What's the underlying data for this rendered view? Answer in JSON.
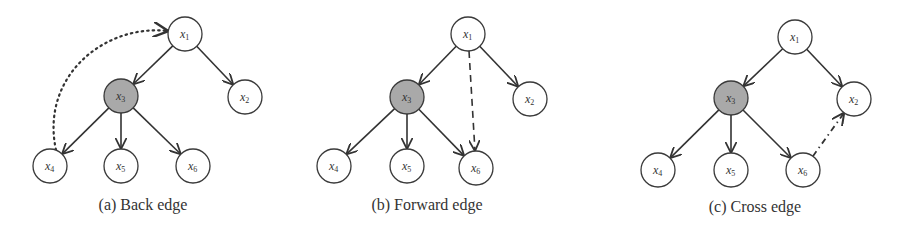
{
  "colors": {
    "stroke": "#333333",
    "node_fill": "#ffffff",
    "highlight_fill": "#a9a9a9",
    "background": "#ffffff"
  },
  "panels": [
    {
      "id": "a",
      "caption": "(a) Back edge",
      "caption_pos": [
        143,
        210
      ],
      "nodes": [
        {
          "id": "x1",
          "base": "x",
          "sub": "1",
          "cx": 185,
          "cy": 34,
          "highlight": false
        },
        {
          "id": "x2",
          "base": "x",
          "sub": "2",
          "cx": 245,
          "cy": 97,
          "highlight": false
        },
        {
          "id": "x3",
          "base": "x",
          "sub": "3",
          "cx": 121,
          "cy": 96,
          "highlight": true
        },
        {
          "id": "x4",
          "base": "x",
          "sub": "4",
          "cx": 50,
          "cy": 166,
          "highlight": false
        },
        {
          "id": "x5",
          "base": "x",
          "sub": "5",
          "cx": 121,
          "cy": 166,
          "highlight": false
        },
        {
          "id": "x6",
          "base": "x",
          "sub": "6",
          "cx": 193,
          "cy": 166,
          "highlight": false
        }
      ],
      "edges": [
        {
          "from": "x1",
          "to": "x3",
          "style": "solid"
        },
        {
          "from": "x1",
          "to": "x2",
          "style": "solid"
        },
        {
          "from": "x3",
          "to": "x4",
          "style": "solid"
        },
        {
          "from": "x3",
          "to": "x5",
          "style": "solid"
        },
        {
          "from": "x3",
          "to": "x6",
          "style": "solid"
        },
        {
          "from": "x4",
          "to": "x1",
          "style": "dotted",
          "curve": true,
          "label": "back-edge"
        }
      ]
    },
    {
      "id": "b",
      "caption": "(b) Forward edge",
      "caption_pos": [
        427,
        210
      ],
      "nodes": [
        {
          "id": "x1",
          "base": "x",
          "sub": "1",
          "cx": 468,
          "cy": 34,
          "highlight": false
        },
        {
          "id": "x2",
          "base": "x",
          "sub": "2",
          "cx": 530,
          "cy": 99,
          "highlight": false
        },
        {
          "id": "x3",
          "base": "x",
          "sub": "3",
          "cx": 407,
          "cy": 97,
          "highlight": true
        },
        {
          "id": "x4",
          "base": "x",
          "sub": "4",
          "cx": 334,
          "cy": 166,
          "highlight": false
        },
        {
          "id": "x5",
          "base": "x",
          "sub": "5",
          "cx": 407,
          "cy": 166,
          "highlight": false
        },
        {
          "id": "x6",
          "base": "x",
          "sub": "6",
          "cx": 476,
          "cy": 168,
          "highlight": false
        }
      ],
      "edges": [
        {
          "from": "x1",
          "to": "x3",
          "style": "solid"
        },
        {
          "from": "x1",
          "to": "x2",
          "style": "solid"
        },
        {
          "from": "x3",
          "to": "x4",
          "style": "solid"
        },
        {
          "from": "x3",
          "to": "x5",
          "style": "solid"
        },
        {
          "from": "x3",
          "to": "x6",
          "style": "solid"
        },
        {
          "from": "x1",
          "to": "x6",
          "style": "dashed",
          "label": "forward-edge"
        }
      ]
    },
    {
      "id": "c",
      "caption": "(c) Cross edge",
      "caption_pos": [
        755,
        212
      ],
      "nodes": [
        {
          "id": "x1",
          "base": "x",
          "sub": "1",
          "cx": 795,
          "cy": 37,
          "highlight": false
        },
        {
          "id": "x2",
          "base": "x",
          "sub": "2",
          "cx": 854,
          "cy": 99,
          "highlight": false
        },
        {
          "id": "x3",
          "base": "x",
          "sub": "3",
          "cx": 731,
          "cy": 98,
          "highlight": true
        },
        {
          "id": "x4",
          "base": "x",
          "sub": "4",
          "cx": 658,
          "cy": 170,
          "highlight": false
        },
        {
          "id": "x5",
          "base": "x",
          "sub": "5",
          "cx": 731,
          "cy": 170,
          "highlight": false
        },
        {
          "id": "x6",
          "base": "x",
          "sub": "6",
          "cx": 803,
          "cy": 170,
          "highlight": false
        }
      ],
      "edges": [
        {
          "from": "x1",
          "to": "x3",
          "style": "solid"
        },
        {
          "from": "x1",
          "to": "x2",
          "style": "solid"
        },
        {
          "from": "x3",
          "to": "x4",
          "style": "solid"
        },
        {
          "from": "x3",
          "to": "x5",
          "style": "solid"
        },
        {
          "from": "x3",
          "to": "x6",
          "style": "solid"
        },
        {
          "from": "x6",
          "to": "x2",
          "style": "dashdot",
          "label": "cross-edge"
        }
      ]
    }
  ]
}
